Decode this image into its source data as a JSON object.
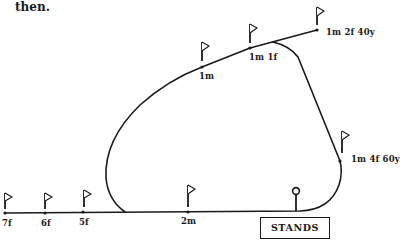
{
  "caption": "then.",
  "diagram": {
    "type": "racecourse-map",
    "colors": {
      "ink": "#1a1a1a",
      "background": "#ffffff"
    },
    "markers": [
      {
        "id": "7f",
        "label": "7f"
      },
      {
        "id": "6f",
        "label": "6f"
      },
      {
        "id": "5f",
        "label": "5f"
      },
      {
        "id": "2m",
        "label": "2m"
      },
      {
        "id": "1m",
        "label": "1m"
      },
      {
        "id": "1m1f",
        "label": "1m 1f"
      },
      {
        "id": "1m2f40y",
        "label": "1m 2f 40y"
      },
      {
        "id": "1m4f60y",
        "label": "1m 4f 60y"
      }
    ],
    "finish_post": {
      "icon": "winning-post-icon"
    },
    "stands_label": "STANDS"
  }
}
